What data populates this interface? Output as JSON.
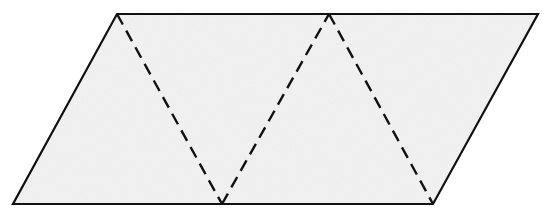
{
  "figure": {
    "kind": "geometry-diagram",
    "canvas": {
      "width": 547,
      "height": 214,
      "background_color": "#ffffff"
    },
    "shape": {
      "name": "parallelogram",
      "fill_color": "#f2f2f2",
      "outline_color": "#111111",
      "outline_width": 2.2,
      "vertices": [
        {
          "label": "top-left",
          "x": 117,
          "y": 14
        },
        {
          "label": "top-right",
          "x": 538,
          "y": 14
        },
        {
          "label": "bottom-right",
          "x": 433,
          "y": 204
        },
        {
          "label": "bottom-left",
          "x": 13,
          "y": 204
        }
      ],
      "points_string": "117,14 538,14 433,204 13,204"
    },
    "interior_lines": {
      "style": "dashed",
      "color": "#111111",
      "width": 2.4,
      "dash_pattern": "12 7",
      "description": "zigzag fold lines splitting the parallelogram into four congruent triangles",
      "segments": [
        {
          "name": "fold-1",
          "from_x": 117,
          "from_y": 14,
          "to_x": 222,
          "to_y": 204,
          "d": "M 117 14 L 222 204"
        },
        {
          "name": "fold-2",
          "from_x": 222,
          "from_y": 204,
          "to_x": 329,
          "to_y": 14,
          "d": "M 222 204 L 329 14"
        },
        {
          "name": "fold-3",
          "from_x": 329,
          "from_y": 14,
          "to_x": 433,
          "to_y": 204,
          "d": "M 329 14 L 433 204"
        }
      ]
    },
    "triangles": [
      {
        "name": "triangle-1",
        "vertices": "13,204 117,14 222,204"
      },
      {
        "name": "triangle-2",
        "vertices": "117,14 329,14 222,204"
      },
      {
        "name": "triangle-3",
        "vertices": "222,204 329,14 433,204"
      },
      {
        "name": "triangle-4",
        "vertices": "329,14 538,14 433,204"
      }
    ]
  }
}
